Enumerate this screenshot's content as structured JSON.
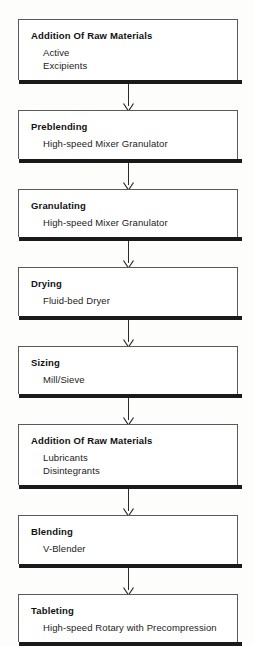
{
  "diagram": {
    "type": "process-flowchart",
    "orientation": "vertical-top-to-bottom",
    "connector_icon": "down-arrow-icon",
    "colors": {
      "box_fill": "#ffffff",
      "box_border": "#5a5a5a",
      "box_shadow_edge": "#1a1a1a",
      "text": "#111111",
      "background": "#fdfdfc"
    },
    "steps": [
      {
        "title": "Addition Of Raw Materials",
        "details": [
          "Active",
          "Excipients"
        ]
      },
      {
        "title": "Preblending",
        "details": [
          "High-speed Mixer Granulator"
        ]
      },
      {
        "title": "Granulating",
        "details": [
          "High-speed Mixer Granulator"
        ]
      },
      {
        "title": "Drying",
        "details": [
          "Fluid-bed Dryer"
        ]
      },
      {
        "title": "Sizing",
        "details": [
          "Mill/Sieve"
        ]
      },
      {
        "title": "Addition Of Raw Materials",
        "details": [
          "Lubricants",
          "Disintegrants"
        ]
      },
      {
        "title": "Blending",
        "details": [
          "V-Blender"
        ]
      },
      {
        "title": "Tableting",
        "details": [
          "High-speed Rotary with Precompression"
        ]
      }
    ]
  }
}
